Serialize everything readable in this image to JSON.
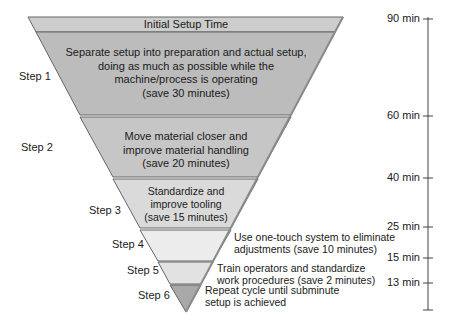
{
  "header": {
    "title": "Initial Setup Time"
  },
  "steps": [
    {
      "label": "Step 1",
      "lines": [
        "Separate setup into preparation and actual setup,",
        "doing as much as possible while the",
        "machine/process is operating",
        "(save 30 minutes)"
      ]
    },
    {
      "label": "Step 2",
      "lines": [
        "Move material closer and",
        "improve material handling",
        "(save 20 minutes)"
      ]
    },
    {
      "label": "Step 3",
      "lines": [
        "Standardize and",
        "improve tooling",
        "(save 15 minutes)"
      ]
    },
    {
      "label": "Step 4",
      "lines": [
        "Use one-touch system to eliminate",
        "adjustments (save 10 minutes)"
      ]
    },
    {
      "label": "Step 5",
      "lines": [
        "Train operators and standardize",
        "work procedures (save 2 minutes)"
      ]
    },
    {
      "label": "Step 6",
      "lines": [
        "Repeat cycle until subminute",
        "setup is achieved"
      ]
    }
  ],
  "scale": {
    "ticks": [
      {
        "label": "90 min"
      },
      {
        "label": "60 min"
      },
      {
        "label": "40 min"
      },
      {
        "label": "25 min"
      },
      {
        "label": "15 min"
      },
      {
        "label": "13 min"
      }
    ]
  },
  "colors": {
    "header": "#c8c8c8",
    "step1": "#bdbdbd",
    "step2": "#c9c9c9",
    "step3": "#dcdcdc",
    "step4": "#ececec",
    "step5": "#e4e4e4",
    "step6": "#a8a8a8",
    "border": "#555555"
  }
}
